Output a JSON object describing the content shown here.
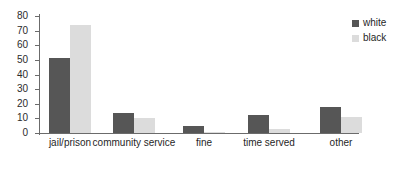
{
  "chart_data": {
    "type": "bar",
    "title": "",
    "xlabel": "",
    "ylabel": "",
    "ylim": [
      0,
      80
    ],
    "yticks": [
      0,
      10,
      20,
      30,
      40,
      50,
      60,
      70,
      80
    ],
    "grid": false,
    "legend_position": "top-right",
    "categories": [
      "jail/prison",
      "community service",
      "fine",
      "time served",
      "other"
    ],
    "series": [
      {
        "name": "white",
        "color": "#565656",
        "values": [
          51,
          14,
          5,
          12,
          18
        ]
      },
      {
        "name": "black",
        "color": "#dcdcdc",
        "values": [
          74,
          10,
          1,
          3,
          11
        ]
      }
    ]
  },
  "legend": {
    "items": [
      {
        "label": "white",
        "color": "#565656"
      },
      {
        "label": "black",
        "color": "#dcdcdc"
      }
    ]
  },
  "axis": {
    "y_tick_labels": [
      "80",
      "70",
      "60",
      "50",
      "40",
      "30",
      "20",
      "10",
      "0"
    ]
  }
}
